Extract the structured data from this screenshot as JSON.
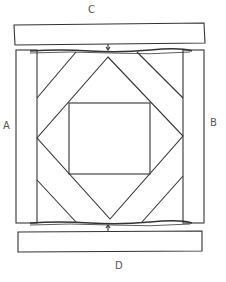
{
  "diagram": {
    "labels": {
      "top": "C",
      "left": "A",
      "right": "B",
      "bottom": "D"
    },
    "colors": {
      "stroke": "#333333",
      "label": "#555555",
      "background": "#ffffff"
    },
    "parts": [
      {
        "id": "strip-c",
        "description": "top border strip"
      },
      {
        "id": "strip-a",
        "description": "left border strip"
      },
      {
        "id": "strip-b",
        "description": "right border strip"
      },
      {
        "id": "strip-d",
        "description": "bottom border strip"
      },
      {
        "id": "center-square",
        "description": "center square"
      },
      {
        "id": "diamond",
        "description": "square-in-a-square diamond"
      },
      {
        "id": "corner-bands",
        "description": "diagonal corner bands"
      }
    ]
  }
}
